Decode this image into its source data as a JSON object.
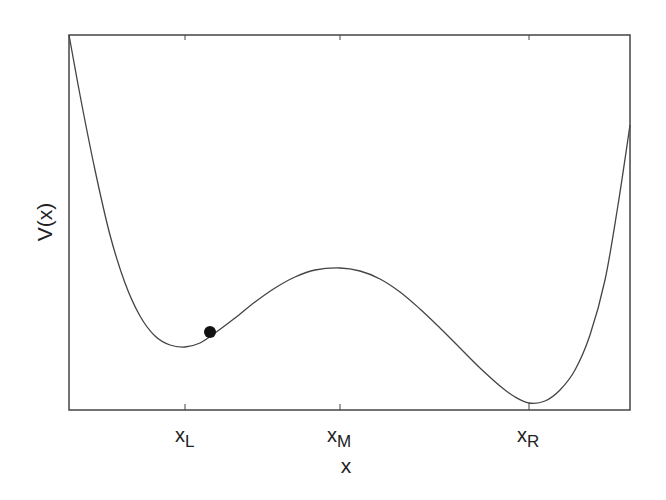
{
  "chart_data": {
    "type": "line",
    "title": "",
    "xlabel": "x",
    "ylabel": "V(x)",
    "grid": false,
    "legend": null,
    "x_ticks": [
      {
        "label": "x",
        "subscript": "L",
        "position": 185
      },
      {
        "label": "x",
        "subscript": "M",
        "position": 340
      },
      {
        "label": "x",
        "subscript": "R",
        "position": 529
      }
    ],
    "y_ticks": [],
    "series": [
      {
        "name": "V(x)",
        "description": "Asymmetric double-well potential: left (shallower) minimum at x_L, local maximum (barrier) at x_M, right (deeper) minimum at x_R",
        "points_px": [
          [
            69,
            35
          ],
          [
            80,
            95
          ],
          [
            95,
            170
          ],
          [
            110,
            235
          ],
          [
            125,
            283
          ],
          [
            140,
            316
          ],
          [
            155,
            336
          ],
          [
            170,
            345
          ],
          [
            185,
            347
          ],
          [
            200,
            343
          ],
          [
            215,
            333
          ],
          [
            235,
            318
          ],
          [
            255,
            302
          ],
          [
            275,
            288
          ],
          [
            295,
            277
          ],
          [
            315,
            270
          ],
          [
            340,
            268
          ],
          [
            360,
            271
          ],
          [
            380,
            279
          ],
          [
            400,
            292
          ],
          [
            420,
            309
          ],
          [
            440,
            328
          ],
          [
            460,
            348
          ],
          [
            480,
            368
          ],
          [
            500,
            386
          ],
          [
            515,
            397
          ],
          [
            529,
            403
          ],
          [
            545,
            401
          ],
          [
            560,
            390
          ],
          [
            575,
            370
          ],
          [
            590,
            335
          ],
          [
            605,
            280
          ],
          [
            618,
            205
          ],
          [
            630,
            125
          ]
        ]
      }
    ],
    "annotations": [
      {
        "type": "ball",
        "description": "particle resting on slope of left well",
        "position_px": [
          210,
          332
        ],
        "color": "#111111"
      }
    ],
    "plot_box_px": {
      "left": 69,
      "top": 35,
      "right": 630,
      "bottom": 410
    }
  },
  "colors": {
    "axis": "#444444",
    "curve": "#444444",
    "ball": "#111111",
    "background": "#ffffff"
  },
  "labels": {
    "ylabel": "V(x)",
    "xlabel": "x",
    "xL_main": "x",
    "xL_sub": "L",
    "xM_main": "x",
    "xM_sub": "M",
    "xR_main": "x",
    "xR_sub": "R"
  }
}
